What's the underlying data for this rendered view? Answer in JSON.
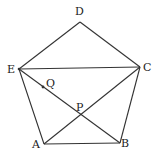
{
  "diagram": {
    "points": {
      "A": {
        "label": "A",
        "x": 44,
        "y": 144,
        "lx": 32,
        "ly": 148
      },
      "B": {
        "label": "B",
        "x": 120,
        "y": 143,
        "lx": 121,
        "ly": 147
      },
      "C": {
        "label": "C",
        "x": 140,
        "y": 67,
        "lx": 143,
        "ly": 71
      },
      "D": {
        "label": "D",
        "x": 80,
        "y": 22,
        "lx": 75,
        "ly": 15
      },
      "E": {
        "label": "E",
        "x": 19,
        "y": 69,
        "lx": 7,
        "ly": 73
      },
      "P": {
        "label": "P",
        "x": 80,
        "y": 115,
        "lx": 76,
        "ly": 111
      },
      "Q": {
        "label": "Q",
        "x": 43,
        "y": 87,
        "lx": 46,
        "ly": 87
      }
    },
    "segments": [
      "AB",
      "BC",
      "CD",
      "DE",
      "EA",
      "EC",
      "EB",
      "AC"
    ],
    "colors": {
      "line": "#333333",
      "text": "#222222",
      "background": "#ffffff"
    }
  }
}
